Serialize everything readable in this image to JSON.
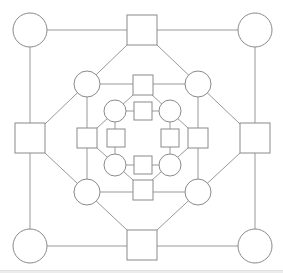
{
  "diagram": {
    "width": 283,
    "height": 270,
    "stroke_color": "#999999",
    "node_stroke_color": "#8a8a8a",
    "fill_color": "#ffffff",
    "edges": [
      [
        30,
        30,
        255,
        30
      ],
      [
        30,
        30,
        30,
        246
      ],
      [
        255,
        30,
        255,
        246
      ],
      [
        30,
        246,
        255,
        246
      ],
      [
        127,
        45,
        45,
        124
      ],
      [
        157,
        45,
        240,
        124
      ],
      [
        45,
        153,
        127,
        230
      ],
      [
        240,
        153,
        157,
        230
      ],
      [
        87,
        84,
        198,
        84
      ],
      [
        87,
        84,
        87,
        192
      ],
      [
        198,
        84,
        198,
        192
      ],
      [
        87,
        192,
        198,
        192
      ],
      [
        133,
        95,
        97,
        128
      ],
      [
        152,
        95,
        188,
        128
      ],
      [
        97,
        148,
        133,
        180
      ],
      [
        188,
        148,
        152,
        180
      ],
      [
        115,
        111,
        170,
        111
      ],
      [
        115,
        111,
        115,
        165
      ],
      [
        170,
        111,
        170,
        165
      ],
      [
        115,
        165,
        170,
        165
      ]
    ],
    "circles": [
      {
        "name": "outer-top-left",
        "cx": 30,
        "cy": 30,
        "r": 17
      },
      {
        "name": "outer-top-right",
        "cx": 255,
        "cy": 30,
        "r": 17
      },
      {
        "name": "outer-bottom-left",
        "cx": 30,
        "cy": 246,
        "r": 17
      },
      {
        "name": "outer-bottom-right",
        "cx": 255,
        "cy": 246,
        "r": 17
      },
      {
        "name": "middle-top-left",
        "cx": 87,
        "cy": 84,
        "r": 13
      },
      {
        "name": "middle-top-right",
        "cx": 198,
        "cy": 84,
        "r": 13
      },
      {
        "name": "middle-bottom-left",
        "cx": 87,
        "cy": 192,
        "r": 13
      },
      {
        "name": "middle-bottom-right",
        "cx": 198,
        "cy": 192,
        "r": 13
      },
      {
        "name": "inner-top-left",
        "cx": 115,
        "cy": 111,
        "r": 11
      },
      {
        "name": "inner-top-right",
        "cx": 170,
        "cy": 111,
        "r": 11
      },
      {
        "name": "inner-bottom-left",
        "cx": 115,
        "cy": 165,
        "r": 11
      },
      {
        "name": "inner-bottom-right",
        "cx": 170,
        "cy": 165,
        "r": 11
      }
    ],
    "squares": [
      {
        "name": "outer-top",
        "cx": 142,
        "cy": 30,
        "s": 30
      },
      {
        "name": "outer-bottom",
        "cx": 142,
        "cy": 245,
        "s": 30
      },
      {
        "name": "outer-left",
        "cx": 30,
        "cy": 138,
        "s": 30
      },
      {
        "name": "outer-right",
        "cx": 255,
        "cy": 138,
        "s": 30
      },
      {
        "name": "middle-top",
        "cx": 143,
        "cy": 85,
        "s": 20
      },
      {
        "name": "middle-bottom",
        "cx": 143,
        "cy": 190,
        "s": 20
      },
      {
        "name": "middle-left",
        "cx": 87,
        "cy": 138,
        "s": 20
      },
      {
        "name": "middle-right",
        "cx": 198,
        "cy": 138,
        "s": 20
      },
      {
        "name": "inner-top",
        "cx": 143,
        "cy": 111,
        "s": 18
      },
      {
        "name": "inner-bottom",
        "cx": 143,
        "cy": 165,
        "s": 18
      },
      {
        "name": "inner-left",
        "cx": 116,
        "cy": 138,
        "s": 18
      },
      {
        "name": "inner-right",
        "cx": 170,
        "cy": 138,
        "s": 18
      }
    ]
  }
}
